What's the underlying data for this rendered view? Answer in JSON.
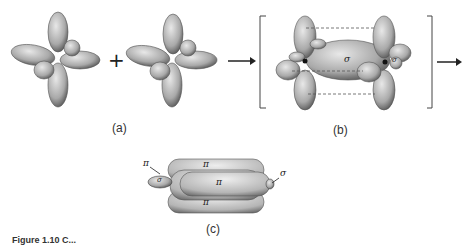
{
  "figure": {
    "panels": [
      {
        "id": "a",
        "label": "(a)",
        "description": "Two sp3 hybridized atoms with four lobes each, combined"
      },
      {
        "id": "b",
        "label": "(b)",
        "description": "Overlap forming sigma bond with parallel p lobes (dashed lines)",
        "bond_label": "σ",
        "side_label": "σ"
      },
      {
        "id": "c",
        "label": "(c)",
        "description": "Triple-bond-like pi clouds around sigma axis",
        "annotations": [
          "π",
          "π",
          "π",
          "π",
          "σ",
          "σ"
        ]
      }
    ],
    "operators": {
      "plus": "+",
      "arrow": "→"
    },
    "caption": "Figure 1.10  C..."
  },
  "colors": {
    "lobe_fill": "#bdbdbd",
    "lobe_edge": "#4a4a4a",
    "line": "#333333",
    "background": "#ffffff"
  }
}
